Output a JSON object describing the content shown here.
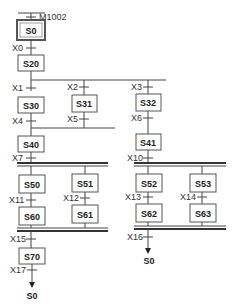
{
  "diagram": {
    "type": "sfc",
    "initial_condition": "M1002",
    "steps": {
      "s0": "S0",
      "s20": "S20",
      "s30": "S30",
      "s31": "S31",
      "s32": "S32",
      "s40": "S40",
      "s41": "S41",
      "s50": "S50",
      "s51": "S51",
      "s52": "S52",
      "s53": "S53",
      "s60": "S60",
      "s61": "S61",
      "s62": "S62",
      "s63": "S63",
      "s70": "S70"
    },
    "transitions": {
      "x0": "X0",
      "x1": "X1",
      "x2": "X2",
      "x3": "X3",
      "x4": "X4",
      "x5": "X5",
      "x6": "X6",
      "x7": "X7",
      "x10": "X10",
      "x11": "X11",
      "x12": "X12",
      "x13": "X13",
      "x14": "X14",
      "x15": "X15",
      "x16": "X16",
      "x17": "X17"
    },
    "jump_targets": {
      "left": "S0",
      "right": "S0"
    }
  }
}
